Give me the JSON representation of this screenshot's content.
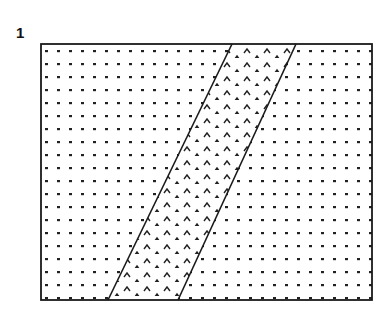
{
  "figure": {
    "label": "1",
    "frame": {
      "x": 41,
      "y": 44,
      "width": 331,
      "height": 256
    },
    "band": {
      "top_left_x": 232,
      "top_right_x": 296,
      "bottom_left_x": 108,
      "bottom_right_x": 178
    },
    "patterns": {
      "background": "dot-pattern",
      "band": "chevron-pattern"
    },
    "colors": {
      "ink": "#1a1a1a",
      "paper": "#ffffff"
    }
  }
}
